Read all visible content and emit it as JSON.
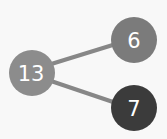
{
  "diagram": {
    "type": "number-bond",
    "whole": {
      "value": "13",
      "color": "#8c8c8c",
      "cx": 32,
      "cy": 73,
      "r": 23
    },
    "parts": [
      {
        "value": "6",
        "color": "#7b7b7b",
        "cx": 134,
        "cy": 40,
        "r": 23
      },
      {
        "value": "7",
        "color": "#3b3b3b",
        "cx": 134,
        "cy": 108,
        "r": 23
      }
    ],
    "connector_color": "#878787"
  }
}
